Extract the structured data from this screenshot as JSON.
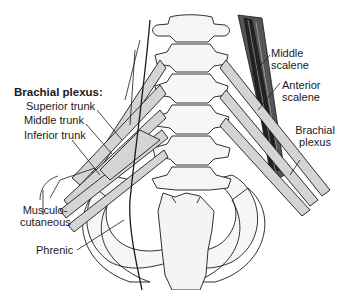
{
  "diagram": {
    "colors": {
      "nerve_fill": "#d4d4d4",
      "bone_fill": "#f4f4f4",
      "outline": "#1a1a1a",
      "muscle": "#2b2b2b",
      "background": "#ffffff"
    }
  },
  "labels": {
    "brachial_plexus_title": "Brachial plexus:",
    "superior_trunk": "Superior trunk",
    "middle_trunk": "Middle trunk",
    "inferior_trunk": "Inferior trunk",
    "musculo_line1": "Musculo-",
    "musculo_line2": "cutaneous",
    "phrenic": "Phrenic",
    "middle_scalene_line1": "Middle",
    "middle_scalene_line2": "scalene",
    "anterior_scalene_line1": "Anterior",
    "anterior_scalene_line2": "scalene",
    "brachial_plexus_right_line1": "Brachial",
    "brachial_plexus_right_line2": "plexus"
  }
}
